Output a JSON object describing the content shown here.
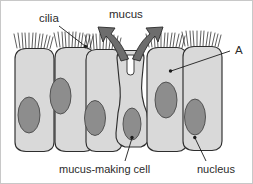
{
  "figure": {
    "background_color": "#ffffff",
    "border_color": "#c8c8c8"
  },
  "labels": {
    "cilia": "cilia",
    "mucus": "mucus",
    "a": "A",
    "mucus_making_cell": "mucus-making cell",
    "nucleus": "nucleus"
  },
  "colors": {
    "cell_fill": "#d9d9d9",
    "cell_outline": "#2e2e2e",
    "nucleus_fill": "#8d8d8d",
    "nucleus_outline": "#4a4a4a",
    "arrow_fill": "#6d6d6d",
    "cilia_stroke": "#2a2a2a",
    "text": "#2b2b2b",
    "leader_line": "#1c1c1c"
  },
  "structures": {
    "cell_count": 6,
    "nucleus_count": 6,
    "cilia_tuft_count": 5,
    "mucus_arrow_count": 2,
    "goblet_cell_index": 3,
    "pore_present": true
  },
  "callouts": [
    {
      "name": "cilia",
      "text": "cilia",
      "text_x": 38,
      "text_y": 21,
      "anchor_x": 84,
      "anchor_y": 46
    },
    {
      "name": "mucus",
      "text": "mucus",
      "text_x": 108,
      "text_y": 17,
      "anchor_x": null,
      "anchor_y": null
    },
    {
      "name": "a",
      "text": "A",
      "text_x": 237,
      "text_y": 52,
      "anchor_x": 170,
      "anchor_y": 70
    },
    {
      "name": "mucus-making-cell",
      "text": "mucus-making cell",
      "text_x": 58,
      "text_y": 169,
      "anchor_x": 131,
      "anchor_y": 138
    },
    {
      "name": "nucleus",
      "text": "nucleus",
      "text_x": 196,
      "text_y": 169,
      "anchor_x": 194,
      "anchor_y": 138
    }
  ]
}
